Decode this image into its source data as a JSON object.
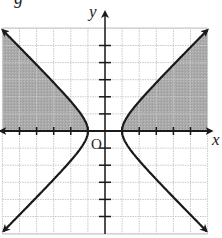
{
  "figure": {
    "partial_caption_glyph": "g",
    "x_axis_label": "x",
    "y_axis_label": "y",
    "origin_label": "O"
  },
  "chart_data": {
    "type": "diagram",
    "equation": "x^2 - y^2 = 1",
    "shaded_region": "x^2 - y^2 >= 1 and y >= 0",
    "xlim": [
      -6,
      6
    ],
    "ylim": [
      -6,
      6
    ],
    "grid": true,
    "grid_step": 1,
    "vertices": [
      [
        -1,
        0
      ],
      [
        1,
        0
      ]
    ],
    "asymptotes": [
      "y = x",
      "y = -x"
    ],
    "xlabel": "x",
    "ylabel": "y"
  },
  "colors": {
    "shade": "#a9a9a9",
    "grid": "#c8c8c8",
    "curve": "#1a1a1a",
    "axis": "#1a1a1a"
  }
}
